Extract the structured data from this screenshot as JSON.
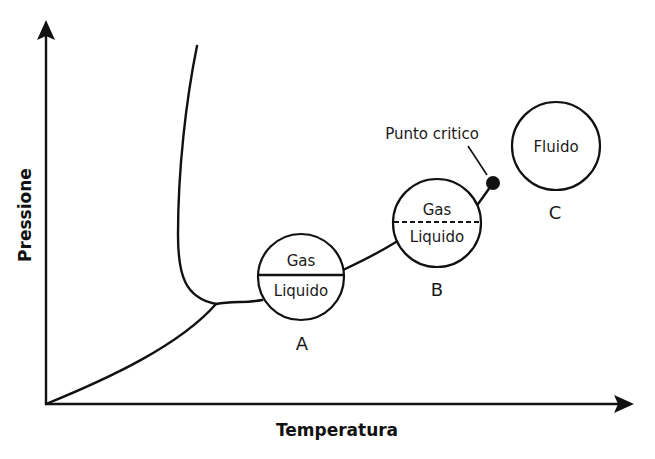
{
  "diagram": {
    "type": "phase-diagram",
    "axes": {
      "x_label": "Temperatura",
      "y_label": "Pressione"
    },
    "annotations": {
      "critical_point": "Punto critico"
    },
    "states": [
      {
        "id": "A",
        "letter": "A",
        "top_label": "Gas",
        "bottom_label": "Liquido",
        "divider": "solid"
      },
      {
        "id": "B",
        "letter": "B",
        "top_label": "Gas",
        "bottom_label": "Liquido",
        "divider": "dashed"
      },
      {
        "id": "C",
        "letter": "C",
        "label": "Fluido"
      }
    ],
    "colors": {
      "line": "#111111",
      "background": "#ffffff"
    }
  }
}
